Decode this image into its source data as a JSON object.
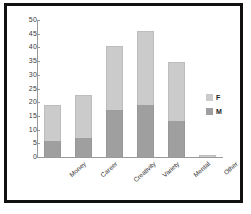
{
  "chart_data": {
    "type": "bar",
    "stacked": true,
    "title": "",
    "xlabel": "",
    "ylabel": "",
    "ylim": [
      0,
      50
    ],
    "yticks": [
      0,
      5,
      10,
      15,
      20,
      25,
      30,
      35,
      40,
      45,
      50
    ],
    "grid": false,
    "legend_position": "right",
    "categories": [
      "Money",
      "Career",
      "Creativity",
      "Variety",
      "Mental",
      "Other"
    ],
    "series": [
      {
        "name": "M",
        "color": "#9f9f9f",
        "values": [
          6,
          7,
          17,
          19,
          13,
          0
        ]
      },
      {
        "name": "F",
        "color": "#cbcbcb",
        "values": [
          13,
          15.5,
          23.5,
          27,
          21.5,
          0.7
        ]
      }
    ],
    "totals": [
      19,
      22.5,
      40.5,
      46,
      34.5,
      0.7
    ]
  },
  "legend": {
    "items": [
      {
        "label": "F",
        "color": "#cbcbcb"
      },
      {
        "label": "M",
        "color": "#9f9f9f"
      }
    ]
  },
  "colors": {
    "female": "#cbcbcb",
    "male": "#9f9f9f",
    "axis": "#9a9a9a",
    "frame": "#111111",
    "background": "#ffffff"
  }
}
